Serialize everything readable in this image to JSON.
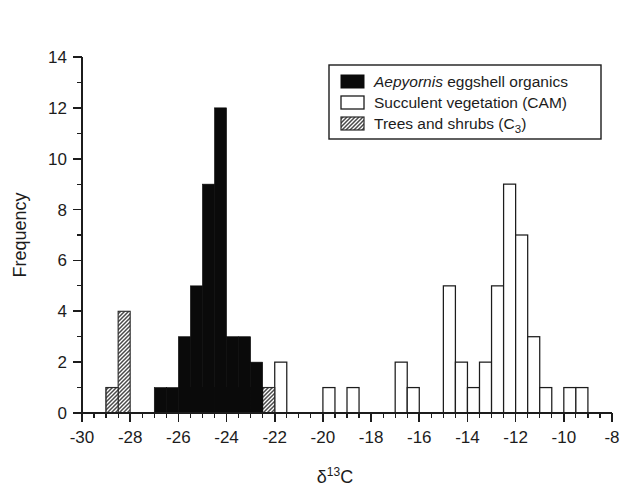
{
  "chart_data": {
    "type": "bar",
    "title": "",
    "subtitle": "",
    "xlabel": "δ¹³C",
    "ylabel": "Frequency",
    "xlim": [
      -30,
      -8
    ],
    "ylim": [
      0,
      14
    ],
    "grid": false,
    "bin_width": 0.5,
    "x_major_ticks": [
      -30,
      -28,
      -26,
      -24,
      -22,
      -20,
      -18,
      -16,
      -14,
      -12,
      -10,
      -8
    ],
    "x_major_tick_labels": [
      "-30",
      "-28",
      "-26",
      "-24",
      "-22",
      "-20",
      "-18",
      "-16",
      "-14",
      "-12",
      "-10",
      "-8"
    ],
    "x_minor_tick_step": 0.5,
    "y_major_ticks": [
      0,
      2,
      4,
      6,
      8,
      10,
      12,
      14
    ],
    "y_major_tick_labels": [
      "0",
      "2",
      "4",
      "6",
      "8",
      "10",
      "12",
      "14"
    ],
    "y_minor_tick_step": 1,
    "legend_position": "top-right",
    "series": [
      {
        "name": "Aepyornis eggshell organics",
        "name_italic_prefix": "Aepyornis",
        "name_rest": " eggshell organics",
        "style": "solid-black",
        "color": "#0a0a0a",
        "bins": [
          {
            "x0": -27.0,
            "x1": -26.5,
            "value": 1
          },
          {
            "x0": -26.5,
            "x1": -26.0,
            "value": 1
          },
          {
            "x0": -26.0,
            "x1": -25.5,
            "value": 3
          },
          {
            "x0": -25.5,
            "x1": -25.0,
            "value": 5
          },
          {
            "x0": -25.0,
            "x1": -24.5,
            "value": 9
          },
          {
            "x0": -24.5,
            "x1": -24.0,
            "value": 12
          },
          {
            "x0": -24.0,
            "x1": -23.5,
            "value": 3
          },
          {
            "x0": -23.5,
            "x1": -23.0,
            "value": 3
          },
          {
            "x0": -23.0,
            "x1": -22.5,
            "value": 2
          }
        ]
      },
      {
        "name": "Succulent vegetation (CAM)",
        "style": "open-outline",
        "color": "#ffffff",
        "bins": [
          {
            "x0": -29.0,
            "x1": -28.5,
            "value": 1
          },
          {
            "x0": -22.5,
            "x1": -22.0,
            "value": 1
          },
          {
            "x0": -22.0,
            "x1": -21.5,
            "value": 2
          },
          {
            "x0": -20.0,
            "x1": -19.5,
            "value": 1
          },
          {
            "x0": -19.0,
            "x1": -18.5,
            "value": 1
          },
          {
            "x0": -17.0,
            "x1": -16.5,
            "value": 2
          },
          {
            "x0": -16.5,
            "x1": -16.0,
            "value": 1
          },
          {
            "x0": -15.0,
            "x1": -14.5,
            "value": 5
          },
          {
            "x0": -14.5,
            "x1": -14.0,
            "value": 2
          },
          {
            "x0": -14.0,
            "x1": -13.5,
            "value": 1
          },
          {
            "x0": -13.5,
            "x1": -13.0,
            "value": 2
          },
          {
            "x0": -13.0,
            "x1": -12.5,
            "value": 5
          },
          {
            "x0": -12.5,
            "x1": -12.0,
            "value": 9
          },
          {
            "x0": -12.0,
            "x1": -11.5,
            "value": 7
          },
          {
            "x0": -11.5,
            "x1": -11.0,
            "value": 3
          },
          {
            "x0": -11.0,
            "x1": -10.5,
            "value": 1
          },
          {
            "x0": -10.0,
            "x1": -9.5,
            "value": 1
          },
          {
            "x0": -9.5,
            "x1": -9.0,
            "value": 1
          }
        ]
      },
      {
        "name": "Trees and shrubs (C3)",
        "name_prefix": "Trees and shrubs (C",
        "name_subscript": "3",
        "name_suffix": ")",
        "style": "gray-hatched",
        "color": "#9a9a9a",
        "bins": [
          {
            "x0": -28.5,
            "x1": -28.0,
            "value": 4
          },
          {
            "x0": -29.0,
            "x1": -28.5,
            "value": 1
          },
          {
            "x0": -25.5,
            "x1": -25.0,
            "value": 1
          },
          {
            "x0": -24.5,
            "x1": -24.0,
            "value": 1
          },
          {
            "x0": -23.5,
            "x1": -23.0,
            "value": 1
          },
          {
            "x0": -22.5,
            "x1": -22.0,
            "value": 1
          }
        ]
      }
    ]
  },
  "legend": {
    "items": [
      {
        "label": "Aepyornis eggshell organics",
        "swatch": "solid-black-swatch"
      },
      {
        "label": "Succulent vegetation (CAM)",
        "swatch": "open-outline-swatch"
      },
      {
        "label": "Trees and shrubs (C3)",
        "swatch": "gray-hatched-swatch"
      }
    ]
  },
  "axes": {
    "x_title": "δ¹³C",
    "y_title": "Frequency"
  },
  "colors": {
    "eggshell": "#0a0a0a",
    "cam": "#ffffff",
    "trees": "#9a9a9a",
    "axis": "#1c1c1c",
    "background": "#ffffff"
  }
}
